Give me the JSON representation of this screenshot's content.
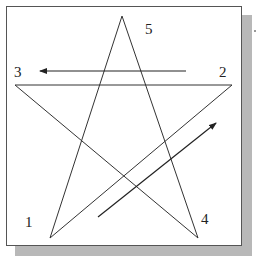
{
  "diagram": {
    "type": "pentagram-stroke-order",
    "stroke_color": "#333333",
    "arrow_color": "#222222",
    "vertices": [
      {
        "id": "1",
        "label": "1",
        "x": 50,
        "y": 238
      },
      {
        "id": "2",
        "label": "2",
        "x": 232,
        "y": 85
      },
      {
        "id": "3",
        "label": "3",
        "x": 15,
        "y": 85
      },
      {
        "id": "4",
        "label": "4",
        "x": 198,
        "y": 238
      },
      {
        "id": "5",
        "label": "5",
        "x": 122,
        "y": 16
      }
    ],
    "labels": {
      "v1": "1",
      "v2": "2",
      "v3": "3",
      "v4": "4",
      "v5": "5"
    },
    "arrows": [
      {
        "name": "arrow-2-to-3",
        "from": [
          186,
          71
        ],
        "to": [
          40,
          71
        ]
      },
      {
        "name": "arrow-1-to-2",
        "from": [
          98,
          217
        ],
        "to": [
          216,
          123
        ]
      }
    ]
  }
}
